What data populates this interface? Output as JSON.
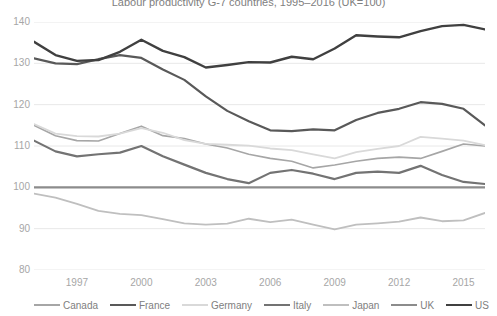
{
  "chart_data": {
    "type": "line",
    "title": "Labour productivity G-7 countries, 1995–2016 (UK=100)",
    "xlabel": "",
    "ylabel": "",
    "ylim": [
      80,
      140
    ],
    "xlim": [
      1995,
      2016
    ],
    "grid": "horizontal",
    "legend_position": "bottom",
    "yticks": [
      "140",
      "130",
      "120",
      "110",
      "100",
      "90",
      "80"
    ],
    "ytick_values": [
      140,
      130,
      120,
      110,
      100,
      90,
      80
    ],
    "xticks": [
      "1997",
      "2000",
      "2003",
      "2006",
      "2009",
      "2012",
      "2015"
    ],
    "xtick_values": [
      1997,
      2000,
      2003,
      2006,
      2009,
      2012,
      2015
    ],
    "x": [
      1995,
      1996,
      1997,
      1998,
      1999,
      2000,
      2001,
      2002,
      2003,
      2004,
      2005,
      2006,
      2007,
      2008,
      2009,
      2010,
      2011,
      2012,
      2013,
      2014,
      2015,
      2016
    ],
    "series": [
      {
        "name": "Canada",
        "color": "#a6a6a6",
        "width": 1.6,
        "values": [
          115.0,
          112.5,
          111.3,
          111.2,
          113.0,
          114.8,
          112.5,
          111.8,
          110.5,
          109.5,
          108.0,
          107.0,
          106.3,
          104.7,
          105.4,
          106.3,
          107.0,
          107.3,
          107.0,
          108.7,
          110.5,
          110.0
        ]
      },
      {
        "name": "France",
        "color": "#595959",
        "width": 2.2,
        "values": [
          131.2,
          130.0,
          129.8,
          131.0,
          132.0,
          131.3,
          128.5,
          126.0,
          122.0,
          118.5,
          116.0,
          113.8,
          113.6,
          114.0,
          113.8,
          116.3,
          118.0,
          119.0,
          120.6,
          120.2,
          119.0,
          115.0
        ]
      },
      {
        "name": "Germany",
        "color": "#d9d9d9",
        "width": 1.8,
        "values": [
          115.3,
          113.0,
          112.4,
          112.3,
          113.0,
          114.3,
          113.2,
          111.4,
          110.5,
          110.3,
          110.1,
          109.4,
          109.0,
          108.0,
          107.0,
          108.5,
          109.3,
          110.0,
          112.2,
          111.8,
          111.3,
          110.2
        ]
      },
      {
        "name": "Italy",
        "color": "#737373",
        "width": 2.2,
        "values": [
          111.3,
          108.7,
          107.5,
          108.0,
          108.4,
          110.0,
          107.5,
          105.5,
          103.5,
          102.0,
          101.0,
          103.5,
          104.2,
          103.3,
          102.0,
          103.5,
          103.8,
          103.5,
          105.2,
          103.0,
          101.3,
          100.8
        ]
      },
      {
        "name": "Japan",
        "color": "#bfbfbf",
        "width": 1.8,
        "values": [
          98.5,
          97.5,
          96.0,
          94.3,
          93.6,
          93.3,
          92.3,
          91.3,
          91.0,
          91.2,
          92.4,
          91.6,
          92.2,
          91.0,
          89.8,
          91.0,
          91.3,
          91.7,
          92.7,
          91.8,
          92.0,
          93.8
        ]
      },
      {
        "name": "UK",
        "color": "#8c8c8c",
        "width": 2.2,
        "values": [
          100,
          100,
          100,
          100,
          100,
          100,
          100,
          100,
          100,
          100,
          100,
          100,
          100,
          100,
          100,
          100,
          100,
          100,
          100,
          100,
          100,
          100
        ]
      },
      {
        "name": "US",
        "color": "#404040",
        "width": 2.4,
        "values": [
          135.2,
          132.0,
          130.6,
          130.8,
          132.8,
          135.7,
          133.0,
          131.5,
          129.0,
          129.6,
          130.3,
          130.2,
          131.6,
          131.0,
          133.6,
          136.8,
          136.5,
          136.3,
          137.8,
          139.0,
          139.3,
          138.2
        ]
      }
    ]
  },
  "axis": {
    "gridline_color": "#e8e8e8",
    "label_color": "#a6a6a6",
    "title_color": "#808080"
  }
}
